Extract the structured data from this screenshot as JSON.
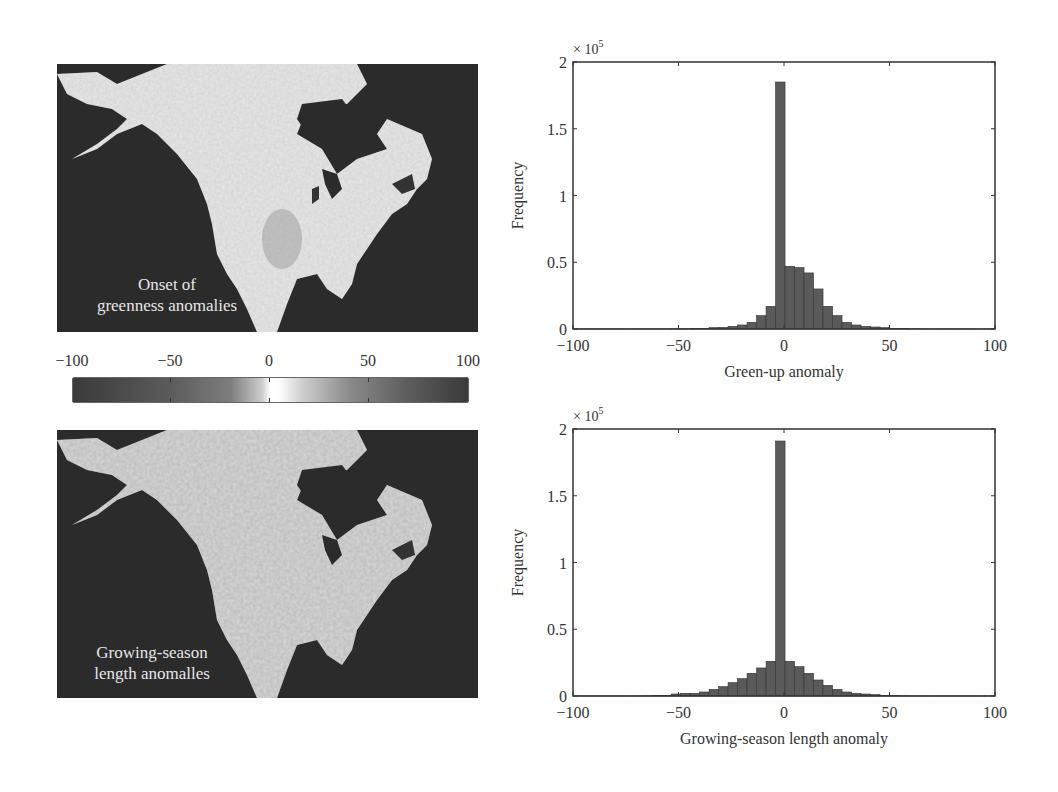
{
  "maps": [
    {
      "label_line1": "Onset of",
      "label_line2": "greenness anomalies"
    },
    {
      "label_line1": "Growing-season",
      "label_line2": "length anomalles"
    }
  ],
  "colorbar": {
    "ticks": [
      "−100",
      "−50",
      "0",
      "50",
      "100"
    ],
    "range": [
      -100,
      100
    ],
    "colors": {
      "extreme": "#3a3a3a",
      "mid": "#7e7e7e",
      "zero": "#ffffff"
    }
  },
  "chart_data": [
    {
      "type": "bar",
      "title": "",
      "xlabel": "Green-up anomaly",
      "ylabel": "Frequency",
      "y_multiplier": "× 10",
      "y_multiplier_exp": "5",
      "xlim": [
        -100,
        100
      ],
      "ylim": [
        0,
        2
      ],
      "xticks": [
        -100,
        -50,
        0,
        50,
        100
      ],
      "xtick_labels": [
        "−100",
        "−50",
        "0",
        "50",
        "100"
      ],
      "yticks": [
        0,
        0.5,
        1,
        1.5,
        2
      ],
      "ytick_labels": [
        "0",
        "0.5",
        "1",
        "1.5",
        "2"
      ],
      "bin_width": 4.5,
      "bin_left_edges": [
        -98.5,
        -94,
        -89.5,
        -85,
        -80.5,
        -76,
        -71.5,
        -67,
        -62.5,
        -58,
        -53.5,
        -49,
        -44.5,
        -40,
        -35.5,
        -31,
        -26.5,
        -22,
        -17.5,
        -13,
        -8.5,
        -4,
        0.5,
        5,
        9.5,
        14,
        18.5,
        23,
        27.5,
        32,
        36.5,
        41,
        45.5,
        50,
        54.5,
        59,
        63.5,
        68,
        72.5,
        77,
        81.5,
        86,
        90.5,
        95
      ],
      "values": [
        0.001,
        0.001,
        0.001,
        0.001,
        0.001,
        0.001,
        0.001,
        0.001,
        0.001,
        0.001,
        0.002,
        0.002,
        0.003,
        0.005,
        0.01,
        0.012,
        0.02,
        0.03,
        0.05,
        0.1,
        0.17,
        1.85,
        0.47,
        0.46,
        0.42,
        0.3,
        0.17,
        0.1,
        0.05,
        0.03,
        0.02,
        0.015,
        0.01,
        0.005,
        0.003,
        0.002,
        0.001,
        0.001,
        0.001,
        0.001,
        0.001,
        0.001,
        0.001,
        0.001
      ],
      "grid": false,
      "bar_color": "#5a5a5a"
    },
    {
      "type": "bar",
      "title": "",
      "xlabel": "Growing-season length anomaly",
      "ylabel": "Frequency",
      "y_multiplier": "× 10",
      "y_multiplier_exp": "5",
      "xlim": [
        -100,
        100
      ],
      "ylim": [
        0,
        2
      ],
      "xticks": [
        -100,
        -50,
        0,
        50,
        100
      ],
      "xtick_labels": [
        "−100",
        "−50",
        "0",
        "50",
        "100"
      ],
      "yticks": [
        0,
        0.5,
        1,
        1.5,
        2
      ],
      "ytick_labels": [
        "0",
        "0.5",
        "1",
        "1.5",
        "2"
      ],
      "bin_width": 4.5,
      "bin_left_edges": [
        -98.5,
        -94,
        -89.5,
        -85,
        -80.5,
        -76,
        -71.5,
        -67,
        -62.5,
        -58,
        -53.5,
        -49,
        -44.5,
        -40,
        -35.5,
        -31,
        -26.5,
        -22,
        -17.5,
        -13,
        -8.5,
        -4,
        0.5,
        5,
        9.5,
        14,
        18.5,
        23,
        27.5,
        32,
        36.5,
        41,
        45.5,
        50,
        54.5,
        59,
        63.5,
        68,
        72.5,
        77,
        81.5,
        86,
        90.5,
        95
      ],
      "values": [
        0.001,
        0.001,
        0.001,
        0.001,
        0.001,
        0.001,
        0.001,
        0.002,
        0.003,
        0.005,
        0.015,
        0.02,
        0.02,
        0.03,
        0.05,
        0.07,
        0.1,
        0.13,
        0.17,
        0.21,
        0.26,
        1.91,
        0.26,
        0.22,
        0.17,
        0.12,
        0.08,
        0.05,
        0.03,
        0.02,
        0.015,
        0.01,
        0.005,
        0.003,
        0.002,
        0.001,
        0.001,
        0.001,
        0.001,
        0.001,
        0.001,
        0.001,
        0.001,
        0.001
      ],
      "grid": false,
      "bar_color": "#5a5a5a"
    }
  ]
}
